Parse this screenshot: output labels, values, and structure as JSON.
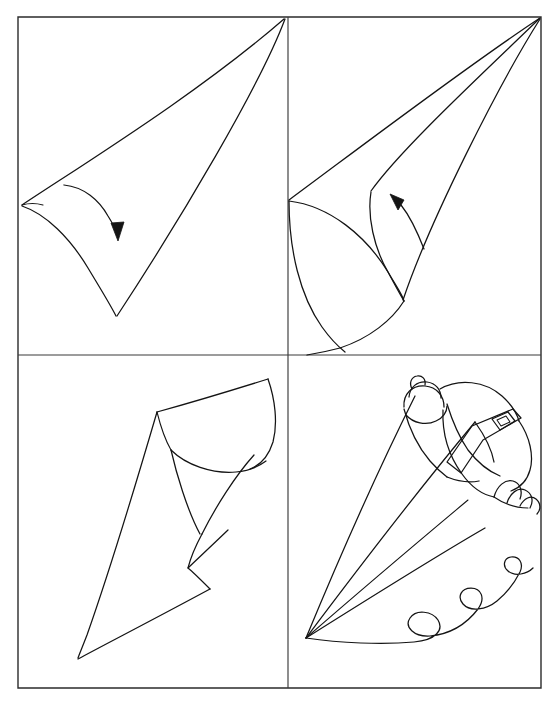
{
  "figure": {
    "kind": "line-art-instructional-diagram",
    "panel_count": 4,
    "background_color": "#ffffff",
    "ink_color": "#141414",
    "frame_color": "#2b2b2b",
    "frame": {
      "x": 18,
      "y": 17,
      "width": 523,
      "height": 671
    },
    "dividers": {
      "vertical_x": 288,
      "horizontal_y": 355
    }
  },
  "panels": [
    {
      "id": "panel-1",
      "position": "top-left",
      "step_number": "1",
      "caption": "",
      "description": "Flat triangular sheet of paper with apex at the upper right corner; the left corner is being curled downward toward the bottom point.",
      "motion_arrow": "curved-arrow-down-right",
      "shapes": [
        "triangle",
        "curled-edge-arc",
        "rolling-arrow"
      ]
    },
    {
      "id": "panel-2",
      "position": "top-right",
      "step_number": "2",
      "caption": "",
      "description": "The paper is rolled further into a loose cone; the curled flap sweeps around and the open side rolls back up toward the apex.",
      "motion_arrow": "curved-arrow-up-left",
      "shapes": [
        "cone-body",
        "rolled-flap-arc",
        "rolling-arrow"
      ]
    },
    {
      "id": "panel-3",
      "position": "bottom-left",
      "step_number": "3",
      "caption": "",
      "description": "The finished paper cone stands point-down to the lower left with the wide open mouth at the upper right and the tail flap folded in.",
      "motion_arrow": "",
      "shapes": [
        "finished-cone",
        "cone-mouth-ellipse",
        "folded-tail-flap"
      ]
    },
    {
      "id": "panel-4",
      "position": "bottom-right",
      "step_number": "4",
      "caption": "",
      "description": "A hand wearing a ring grips the filled cone and squeezes, piping a wavy line of icing along the surface below.",
      "motion_arrow": "",
      "shapes": [
        "hand-gripping-cone",
        "ring-on-finger",
        "cone-in-hand",
        "piped-icing-squiggle"
      ]
    }
  ],
  "legend": {
    "arrow_label": "",
    "note": ""
  }
}
